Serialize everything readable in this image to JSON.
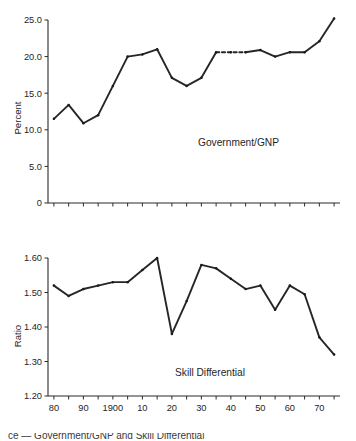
{
  "figure": {
    "background": "#ffffff",
    "line_color": "#262626",
    "text_color": "#1f1f1f"
  },
  "caption": {
    "fragment": "ce — Government/GNP and Skill Differential"
  },
  "chart_data": [
    {
      "type": "line",
      "title": "",
      "annotation": "Government/GNP",
      "xlabel": "",
      "ylabel": "Percent",
      "xlim": [
        1878,
        1977
      ],
      "ylim": [
        0,
        25.0
      ],
      "yticks": [
        0,
        5.0,
        10.0,
        15.0,
        20.0,
        25.0
      ],
      "ytick_labels": [
        "0",
        "5.0",
        "10.0",
        "15.0",
        "20.0",
        "25.0"
      ],
      "xticks": [
        1880,
        1885,
        1890,
        1895,
        1900,
        1905,
        1910,
        1915,
        1920,
        1925,
        1930,
        1935,
        1940,
        1945,
        1950,
        1955,
        1960,
        1965,
        1970,
        1975
      ],
      "xtick_labels": [
        "",
        "",
        "",
        "",
        "",
        "",
        "",
        "",
        "",
        "",
        "",
        "",
        "",
        "",
        "",
        "",
        "",
        "",
        "",
        ""
      ],
      "grid": false,
      "legend": false,
      "x": [
        1880,
        1885,
        1890,
        1895,
        1900,
        1905,
        1910,
        1915,
        1920,
        1925,
        1930,
        1935,
        1940,
        1945,
        1950,
        1955,
        1960,
        1965,
        1970,
        1975
      ],
      "values": [
        11.5,
        13.4,
        10.9,
        12.0,
        16.0,
        20.0,
        20.3,
        21.0,
        17.1,
        16.0,
        17.1,
        20.6,
        20.6,
        20.6,
        20.9,
        20.0,
        20.6,
        20.6,
        22.1,
        25.2
      ],
      "dashed_segment": {
        "from_index": 11,
        "to_index": 13,
        "note": "interpolated war years"
      }
    },
    {
      "type": "line",
      "title": "",
      "annotation": "Skill Differential",
      "xlabel": "",
      "ylabel": "Ratio",
      "xlim": [
        1878,
        1977
      ],
      "ylim": [
        1.2,
        1.6
      ],
      "yticks": [
        1.2,
        1.3,
        1.4,
        1.5,
        1.6
      ],
      "ytick_labels": [
        "1.20",
        "1.30",
        "1.40",
        "1.50",
        "1.60"
      ],
      "xticks": [
        1880,
        1885,
        1890,
        1895,
        1900,
        1905,
        1910,
        1915,
        1920,
        1925,
        1930,
        1935,
        1940,
        1945,
        1950,
        1955,
        1960,
        1965,
        1970,
        1975
      ],
      "xtick_labels": [
        "80",
        "",
        "90",
        "",
        "1900",
        "",
        "10",
        "",
        "20",
        "",
        "30",
        "",
        "40",
        "",
        "50",
        "",
        "60",
        "",
        "70",
        ""
      ],
      "grid": false,
      "legend": false,
      "x": [
        1880,
        1885,
        1890,
        1895,
        1900,
        1905,
        1910,
        1915,
        1920,
        1925,
        1930,
        1935,
        1940,
        1945,
        1950,
        1955,
        1960,
        1965,
        1970,
        1975
      ],
      "values": [
        1.52,
        1.49,
        1.51,
        1.52,
        1.53,
        1.53,
        1.565,
        1.6,
        1.38,
        1.475,
        1.58,
        1.57,
        1.54,
        1.51,
        1.52,
        1.45,
        1.52,
        1.495,
        1.37,
        1.32
      ]
    }
  ]
}
